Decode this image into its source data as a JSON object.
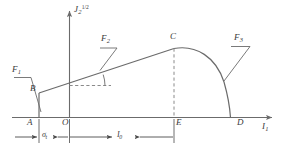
{
  "figure": {
    "colors": {
      "curve": "#6b6b6b",
      "axis": "#6b6b6b",
      "dashed": "#8a8a8a",
      "label": "#3a3a3a",
      "background": "#ffffff"
    }
  },
  "axes": {
    "y_axis": {
      "base": "J",
      "subscript": "2",
      "superscript": "1/2"
    },
    "x_axis": {
      "base": "I",
      "subscript": "1"
    }
  },
  "points": [
    {
      "id": "A",
      "label": "A"
    },
    {
      "id": "B",
      "label": "B"
    },
    {
      "id": "C",
      "label": "C"
    },
    {
      "id": "D",
      "label": "D"
    },
    {
      "id": "E",
      "label": "E"
    },
    {
      "id": "O",
      "label": "O"
    }
  ],
  "surfaces": [
    {
      "id": "F1",
      "base": "F",
      "subscript": "1"
    },
    {
      "id": "F2",
      "base": "F",
      "subscript": "2"
    },
    {
      "id": "F3",
      "base": "F",
      "subscript": "3"
    }
  ],
  "dimensions": [
    {
      "id": "sigma_t",
      "base": "σ",
      "subscript": "t"
    },
    {
      "id": "I0",
      "base": "I",
      "subscript": "0"
    }
  ]
}
